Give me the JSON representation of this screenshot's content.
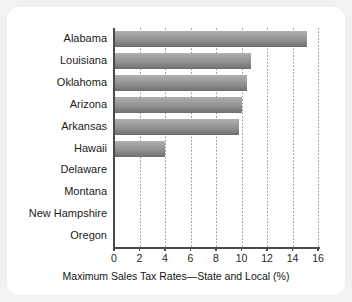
{
  "chart_data": {
    "type": "bar",
    "orientation": "horizontal",
    "title": "",
    "xlabel": "Maximum Sales Tax Rates—State and Local (%)",
    "ylabel": "",
    "categories": [
      "Alabama",
      "Louisiana",
      "Oklahoma",
      "Arizona",
      "Arkansas",
      "Hawaii",
      "Delaware",
      "Montana",
      "New Hampshire",
      "Oregon"
    ],
    "values": [
      15.1,
      10.75,
      10.4,
      10.0,
      9.8,
      4.0,
      0,
      0,
      0,
      0
    ],
    "xlim": [
      0,
      16
    ],
    "xticks": [
      0,
      2,
      4,
      6,
      8,
      10,
      12,
      14,
      16
    ],
    "xticklabels": [
      "0",
      "2",
      "4",
      "6",
      "8",
      "10",
      "12",
      "14",
      "16"
    ],
    "grid": "vertical-dotted",
    "legend": "none",
    "bar_color_top": "#b0b0b0",
    "bar_color_bottom": "#6e6e6e",
    "axis_color": "#4a4a4a",
    "gridline_color": "#9a9a9a",
    "panel_background": "#ffffff",
    "figure_background": "#f2f2f2"
  }
}
